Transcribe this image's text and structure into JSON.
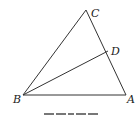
{
  "diagram": {
    "type": "triangle-with-cevian",
    "points": {
      "A": {
        "label": "A",
        "x": 126,
        "y": 95
      },
      "B": {
        "label": "B",
        "x": 23,
        "y": 95
      },
      "C": {
        "label": "C",
        "x": 86,
        "y": 10
      },
      "D": {
        "label": "D",
        "x": 108,
        "y": 51
      }
    },
    "segments": [
      "AB",
      "BC",
      "CA",
      "BD"
    ],
    "line_color": "#333333",
    "caption_partial": "ZZZZ"
  }
}
